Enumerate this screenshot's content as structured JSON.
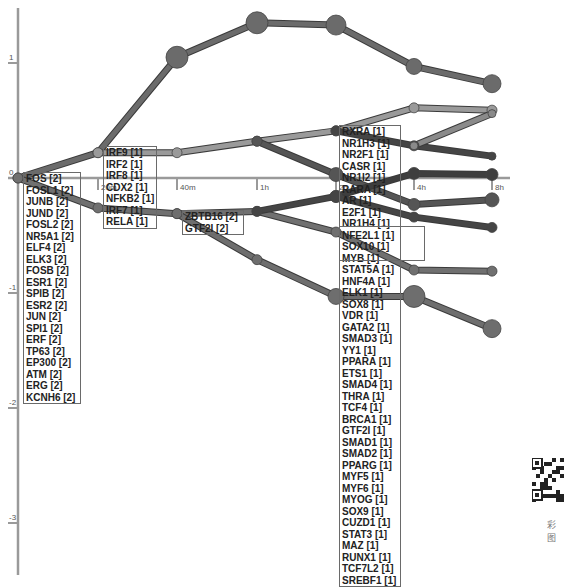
{
  "chart_data": {
    "type": "line",
    "title": "",
    "xlabel": "",
    "ylabel": "",
    "x_ticks": [
      "0",
      "20m",
      "40m",
      "1h",
      "2h",
      "4h",
      "8h"
    ],
    "y_ticks": [
      1,
      0,
      -1,
      -2,
      -3
    ],
    "ylim": [
      -3.4,
      1.5
    ],
    "grid": false,
    "legend": "none",
    "paths": [
      {
        "name": "path-top",
        "color": "#6b6b6b",
        "points": [
          [
            0,
            0
          ],
          [
            1,
            0.22
          ],
          [
            2,
            1.05
          ],
          [
            3,
            1.35
          ],
          [
            4,
            1.33
          ],
          [
            5,
            0.97
          ],
          [
            6,
            0.82
          ]
        ],
        "sizes": [
          5,
          5,
          11,
          11,
          10,
          8,
          9
        ]
      },
      {
        "name": "path-upper-mid",
        "color": "#9a9a9a",
        "points": [
          [
            1,
            0.22
          ],
          [
            2,
            0.22
          ],
          [
            3,
            0.32
          ],
          [
            4,
            0.41
          ],
          [
            5,
            0.61
          ],
          [
            6,
            0.59
          ]
        ],
        "sizes": [
          5,
          5,
          5,
          5,
          5,
          5
        ]
      },
      {
        "name": "path-upper-split-a",
        "color": "#454545",
        "points": [
          [
            4,
            0.41
          ],
          [
            5,
            0.28
          ],
          [
            6,
            0.19
          ]
        ],
        "sizes": [
          5,
          5,
          4
        ]
      },
      {
        "name": "path-upper-split-b",
        "color": "#8a8a8a",
        "points": [
          [
            5,
            0.28
          ],
          [
            6,
            0.56
          ]
        ],
        "sizes": [
          4,
          4
        ]
      },
      {
        "name": "path-mid-down",
        "color": "#555555",
        "points": [
          [
            3,
            0.32
          ],
          [
            4,
            0.03
          ],
          [
            5,
            -0.23
          ],
          [
            6,
            -0.19
          ]
        ],
        "sizes": [
          5,
          7,
          6,
          7
        ]
      },
      {
        "name": "path-mid-up",
        "color": "#3e3e3e",
        "points": [
          [
            4,
            -0.16
          ],
          [
            5,
            0.04
          ],
          [
            6,
            0.03
          ]
        ],
        "sizes": [
          6,
          6,
          6
        ]
      },
      {
        "name": "path-lower-main",
        "color": "#707070",
        "points": [
          [
            0,
            0
          ],
          [
            1,
            -0.26
          ],
          [
            2,
            -0.31
          ],
          [
            3,
            -0.29
          ],
          [
            4,
            -0.47
          ],
          [
            5,
            -0.8
          ],
          [
            6,
            -0.81
          ]
        ],
        "sizes": [
          5,
          5,
          5,
          5,
          5,
          5,
          5
        ]
      },
      {
        "name": "path-lower-branch",
        "color": "#454545",
        "points": [
          [
            3,
            -0.29
          ],
          [
            4,
            -0.16
          ],
          [
            5,
            -0.34
          ],
          [
            6,
            -0.43
          ]
        ],
        "sizes": [
          5,
          6,
          5,
          5
        ]
      },
      {
        "name": "path-bottom",
        "color": "#6e6e6e",
        "points": [
          [
            2,
            -0.31
          ],
          [
            3,
            -0.71
          ],
          [
            4,
            -1.03
          ],
          [
            5,
            -1.03
          ],
          [
            6,
            -1.31
          ]
        ],
        "sizes": [
          5,
          5,
          8,
          11,
          9
        ]
      }
    ],
    "annotations": [
      {
        "anchor": "fos-group",
        "items": [
          "FOS [2]",
          "FOSL1 [2]",
          "JUNB [2]",
          "JUND [2]",
          "FOSL2 [2]",
          "NR5A1 [2]",
          "ELF4 [2]",
          "ELK3 [2]",
          "FOSB [2]",
          "ESR1 [2]",
          "SPIB [2]",
          "ESR2 [2]",
          "JUN [2]",
          "SPI1 [2]",
          "ERF [2]",
          "TP63 [2]",
          "EP300 [2]",
          "ATM [2]",
          "ERG [2]",
          "KCNH6 [2]"
        ]
      },
      {
        "anchor": "irf-group",
        "items": [
          "IRF9 [1]",
          "IRF2 [1]",
          "IRF8 [1]",
          "CDX2 [1]",
          "NFKB2 [1]",
          "IRF7 [1]",
          "RELA [1]"
        ]
      },
      {
        "anchor": "zbtb-group",
        "items": [
          "ZBTB16 [2]",
          "GTF2I [2]"
        ]
      },
      {
        "anchor": "rxra-group",
        "items": [
          "RXRA [1]",
          "NR1H3 [1]",
          "NR2F1 [1]",
          "CASR [1]",
          "NR1I2 [1]",
          "RARA [1]",
          "AR [1]",
          "E2F1 [1]",
          "NR1H4 [1]",
          "NFE2L1 [1]",
          "SOX10 [1]",
          "MYB [1]",
          "STAT5A [1]",
          "HNF4A [1]",
          "ELK1 [1]",
          "SOX8 [1]",
          "VDR [1]",
          "GATA2 [1]",
          "SMAD3 [1]",
          "YY1 [1]",
          "PPARA [1]",
          "ETS1 [1]",
          "SMAD4 [1]",
          "THRA [1]",
          "TCF4 [1]",
          "BRCA1 [1]",
          "GTF2I [1]",
          "SMAD1 [1]",
          "SMAD2 [1]",
          "PPARG [1]",
          "MYF5 [1]",
          "MYF6 [1]",
          "MYOG [1]",
          "SOX9 [1]",
          "CUZD1 [1]",
          "STAT3 [1]",
          "MAZ [1]",
          "RUNX1 [1]",
          "TCF7L2 [1]",
          "SREBF1 [1]"
        ]
      },
      {
        "anchor": "nfe2l1-subgroup",
        "items": [
          "NFE2L1 [1]",
          "SOX10 [1]",
          "MYB [1]"
        ]
      }
    ]
  },
  "watermark": {
    "caption": "彩图"
  }
}
